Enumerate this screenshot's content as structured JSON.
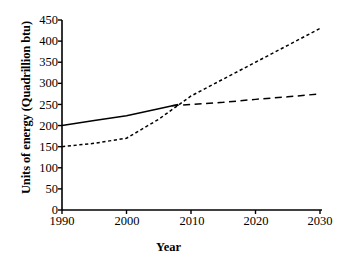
{
  "chart_data": {
    "type": "line",
    "title": "",
    "xlabel": "Year",
    "ylabel": "Units of energy (Quadrillion btu)",
    "xlim": [
      1990,
      2030
    ],
    "ylim": [
      0,
      450
    ],
    "xticks": [
      1990,
      2000,
      2010,
      2020,
      2030
    ],
    "yticks": [
      0,
      50,
      100,
      150,
      200,
      250,
      300,
      350,
      400,
      450
    ],
    "grid": false,
    "legend": "none",
    "series": [
      {
        "name": "solid-history",
        "style": "solid",
        "x": [
          1990,
          1995,
          2000,
          2005,
          2008
        ],
        "values": [
          200,
          212,
          223,
          240,
          250
        ]
      },
      {
        "name": "dotted-high-projection",
        "style": "dotted",
        "x": [
          1990,
          1995,
          2000,
          2005,
          2010,
          2015,
          2020,
          2025,
          2030
        ],
        "values": [
          150,
          158,
          170,
          215,
          270,
          310,
          350,
          390,
          430
        ]
      },
      {
        "name": "dashed-low-projection",
        "style": "dashed",
        "x": [
          2007,
          2010,
          2015,
          2020,
          2025,
          2030
        ],
        "values": [
          247,
          250,
          255,
          262,
          268,
          275
        ]
      }
    ]
  },
  "axis": {
    "x_label": "Year",
    "y_label": "Units of energy (Quadrillion btu)",
    "x_tick_labels": [
      "1990",
      "2000",
      "2010",
      "2020",
      "2030"
    ],
    "y_tick_labels": [
      "450",
      "400",
      "350",
      "300",
      "250",
      "200",
      "150",
      "100",
      "50",
      "0"
    ]
  },
  "colors": {
    "ink": "#000000",
    "background": "#ffffff"
  }
}
